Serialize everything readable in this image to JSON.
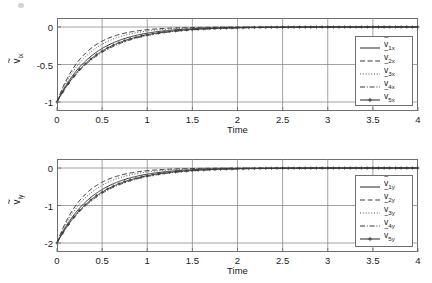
{
  "figure": {
    "background": "#ffffff",
    "line_color": "#3a3a3a",
    "grid_color": "#8c8c8c",
    "frame_color": "#6f6f6f"
  },
  "charts": [
    {
      "id": "top",
      "type": "line",
      "title": "",
      "xlabel": "Time",
      "ylabel_base": "v",
      "ylabel_sub": "ix",
      "xlim": [
        0,
        4
      ],
      "ylim": [
        -1.12,
        0.12
      ],
      "xticks": [
        0,
        0.5,
        1,
        1.5,
        2,
        2.5,
        3,
        3.5,
        4
      ],
      "xticklabels": [
        "0",
        "0.5",
        "1",
        "1.5",
        "2",
        "2.5",
        "3",
        "3.5",
        "4"
      ],
      "yticks": [
        0,
        -0.5,
        -1
      ],
      "yticklabels": [
        "0",
        "-0.5",
        "-1"
      ],
      "grid": true,
      "legend_position": "right",
      "series": [
        {
          "name": "v1x",
          "label_base": "v",
          "label_sub": "1x",
          "style": "solid",
          "y0": -1.0,
          "tau": 0.4,
          "legend_sample": "solid-line"
        },
        {
          "name": "v2x",
          "label_base": "v",
          "label_sub": "2x",
          "style": "dashed",
          "y0": -1.0,
          "tau": 0.3,
          "legend_sample": "dashed-line"
        },
        {
          "name": "v3x",
          "label_base": "v",
          "label_sub": "3x",
          "style": "dotted",
          "y0": -1.0,
          "tau": 0.34,
          "legend_sample": "dotted-line"
        },
        {
          "name": "v4x",
          "label_base": "v",
          "label_sub": "4x",
          "style": "dashdot",
          "y0": -1.0,
          "tau": 0.46,
          "legend_sample": "dashdot-line"
        },
        {
          "name": "v5x",
          "label_base": "v",
          "label_sub": "5x",
          "style": "solid-marker",
          "y0": -1.0,
          "tau": 0.44,
          "legend_sample": "line-with-plus-marker"
        }
      ]
    },
    {
      "id": "bottom",
      "type": "line",
      "title": "",
      "xlabel": "Time",
      "ylabel_base": "v",
      "ylabel_sub": "iy",
      "xlim": [
        0,
        4
      ],
      "ylim": [
        -2.24,
        0.24
      ],
      "xticks": [
        0,
        0.5,
        1,
        1.5,
        2,
        2.5,
        3,
        3.5,
        4
      ],
      "xticklabels": [
        "0",
        "0.5",
        "1",
        "1.5",
        "2",
        "2.5",
        "3",
        "3.5",
        "4"
      ],
      "yticks": [
        0,
        -1,
        -2
      ],
      "yticklabels": [
        "0",
        "-1",
        "-2"
      ],
      "grid": true,
      "legend_position": "right",
      "series": [
        {
          "name": "v1y",
          "label_base": "v",
          "label_sub": "1y",
          "style": "solid",
          "y0": -2.0,
          "tau": 0.4,
          "legend_sample": "solid-line"
        },
        {
          "name": "v2y",
          "label_base": "v",
          "label_sub": "2y",
          "style": "dashed",
          "y0": -2.0,
          "tau": 0.3,
          "legend_sample": "dashed-line"
        },
        {
          "name": "v3y",
          "label_base": "v",
          "label_sub": "3y",
          "style": "dotted",
          "y0": -2.0,
          "tau": 0.34,
          "legend_sample": "dotted-line"
        },
        {
          "name": "v4y",
          "label_base": "v",
          "label_sub": "4y",
          "style": "dashdot",
          "y0": -2.0,
          "tau": 0.46,
          "legend_sample": "dashdot-line"
        },
        {
          "name": "v5y",
          "label_base": "v",
          "label_sub": "5y",
          "style": "solid-marker",
          "y0": -2.0,
          "tau": 0.44,
          "legend_sample": "line-with-plus-marker"
        }
      ]
    }
  ],
  "chart_data": {
    "type": "line",
    "panels": 2,
    "shared_xlabel": "Time",
    "x_range": [
      0,
      4
    ],
    "x_tick_labels": [
      "0",
      "0.5",
      "1",
      "1.5",
      "2",
      "2.5",
      "3",
      "3.5",
      "4"
    ],
    "panel_1": {
      "ylabel": "v~ix",
      "y_range": [
        -1,
        0
      ],
      "y_tick_labels": [
        "0",
        "-0.5",
        "-1"
      ],
      "legend": [
        "v~1x",
        "v~2x",
        "v~3x",
        "v~4x",
        "v~5x"
      ],
      "x": [
        0,
        0.1,
        0.2,
        0.3,
        0.4,
        0.5,
        0.6,
        0.7,
        0.8,
        0.9,
        1.0,
        1.2,
        1.4,
        1.6,
        1.8,
        2.0,
        2.5,
        3.0,
        3.5,
        4.0
      ],
      "series": [
        {
          "name": "v~1x",
          "values": [
            -1.0,
            -0.779,
            -0.607,
            -0.472,
            -0.368,
            -0.287,
            -0.223,
            -0.174,
            -0.135,
            -0.105,
            -0.082,
            -0.05,
            -0.03,
            -0.018,
            -0.011,
            -0.007,
            -0.002,
            -0.001,
            0.0,
            0.0
          ]
        },
        {
          "name": "v~2x",
          "values": [
            -1.0,
            -0.717,
            -0.513,
            -0.368,
            -0.264,
            -0.189,
            -0.135,
            -0.097,
            -0.069,
            -0.05,
            -0.036,
            -0.018,
            -0.009,
            -0.005,
            -0.002,
            -0.001,
            0.0,
            0.0,
            0.0,
            0.0
          ]
        },
        {
          "name": "v~3x",
          "values": [
            -1.0,
            -0.745,
            -0.555,
            -0.414,
            -0.308,
            -0.23,
            -0.171,
            -0.128,
            -0.095,
            -0.071,
            -0.053,
            -0.029,
            -0.016,
            -0.009,
            -0.005,
            -0.003,
            -0.001,
            0.0,
            0.0,
            0.0
          ]
        },
        {
          "name": "v~4x",
          "values": [
            -1.0,
            -0.804,
            -0.647,
            -0.52,
            -0.418,
            -0.337,
            -0.271,
            -0.218,
            -0.175,
            -0.141,
            -0.113,
            -0.073,
            -0.047,
            -0.03,
            -0.02,
            -0.013,
            -0.004,
            -0.001,
            0.0,
            0.0
          ]
        },
        {
          "name": "v~5x",
          "values": [
            -1.0,
            -0.796,
            -0.634,
            -0.505,
            -0.402,
            -0.32,
            -0.255,
            -0.203,
            -0.162,
            -0.129,
            -0.103,
            -0.065,
            -0.041,
            -0.026,
            -0.017,
            -0.01,
            -0.003,
            -0.001,
            0.0,
            0.0
          ]
        }
      ]
    },
    "panel_2": {
      "ylabel": "v~iy",
      "y_range": [
        -2,
        0
      ],
      "y_tick_labels": [
        "0",
        "-1",
        "-2"
      ],
      "legend": [
        "v~1y",
        "v~2y",
        "v~3y",
        "v~4y",
        "v~5y"
      ],
      "x": [
        0,
        0.1,
        0.2,
        0.3,
        0.4,
        0.5,
        0.6,
        0.7,
        0.8,
        0.9,
        1.0,
        1.2,
        1.4,
        1.6,
        1.8,
        2.0,
        2.5,
        3.0,
        3.5,
        4.0
      ],
      "series": [
        {
          "name": "v~1y",
          "values": [
            -2.0,
            -1.557,
            -1.213,
            -0.944,
            -0.736,
            -0.573,
            -0.446,
            -0.347,
            -0.27,
            -0.211,
            -0.164,
            -0.099,
            -0.06,
            -0.037,
            -0.022,
            -0.013,
            -0.004,
            -0.001,
            0.0,
            0.0
          ]
        },
        {
          "name": "v~2y",
          "values": [
            -2.0,
            -1.433,
            -1.027,
            -0.736,
            -0.527,
            -0.378,
            -0.271,
            -0.194,
            -0.139,
            -0.1,
            -0.071,
            -0.037,
            -0.019,
            -0.01,
            -0.005,
            -0.003,
            -0.001,
            0.0,
            0.0,
            0.0
          ]
        },
        {
          "name": "v~3y",
          "values": [
            -2.0,
            -1.49,
            -1.11,
            -0.827,
            -0.616,
            -0.459,
            -0.342,
            -0.255,
            -0.19,
            -0.141,
            -0.105,
            -0.058,
            -0.032,
            -0.018,
            -0.01,
            -0.006,
            -0.001,
            0.0,
            0.0,
            0.0
          ]
        },
        {
          "name": "v~4y",
          "values": [
            -2.0,
            -1.608,
            -1.293,
            -1.04,
            -0.836,
            -0.672,
            -0.541,
            -0.435,
            -0.35,
            -0.281,
            -0.226,
            -0.146,
            -0.094,
            -0.061,
            -0.039,
            -0.025,
            -0.008,
            -0.003,
            -0.001,
            0.0
          ]
        },
        {
          "name": "v~5y",
          "values": [
            -2.0,
            -1.591,
            -1.266,
            -1.007,
            -0.801,
            -0.638,
            -0.507,
            -0.403,
            -0.321,
            -0.255,
            -0.203,
            -0.129,
            -0.081,
            -0.051,
            -0.033,
            -0.021,
            -0.006,
            -0.002,
            -0.001,
            0.0
          ]
        }
      ]
    }
  }
}
